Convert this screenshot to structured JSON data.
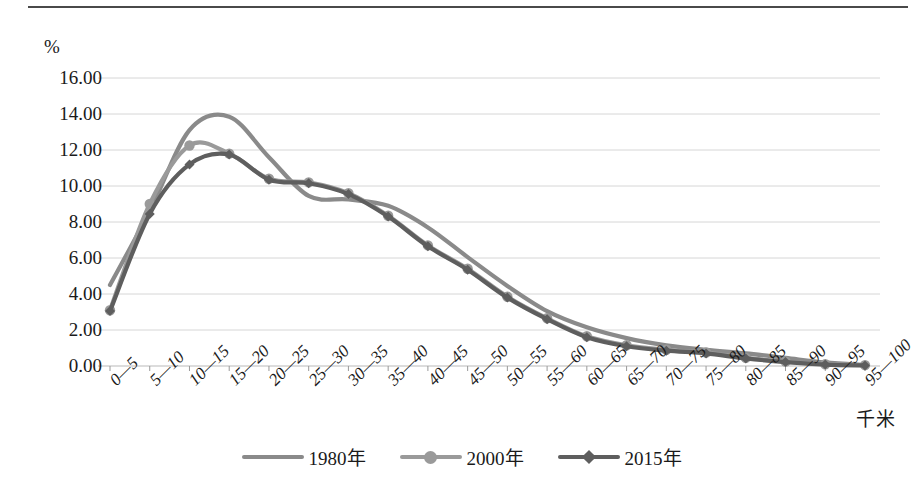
{
  "figure": {
    "y_unit_label": "%",
    "x_unit_label": "千米"
  },
  "legend": {
    "position": "bottom-center",
    "entries": [
      {
        "label": "1980年",
        "color": "#8a8a8a",
        "marker": "none"
      },
      {
        "label": "2000年",
        "color": "#9a9a9a",
        "marker": "circle"
      },
      {
        "label": "2015年",
        "color": "#5e5e5e",
        "marker": "diamond"
      }
    ]
  },
  "chart_data": {
    "type": "line",
    "title": "",
    "xlabel": "千米",
    "ylabel": "%",
    "ylim": [
      0,
      16
    ],
    "ytick_labels": [
      "0.00",
      "2.00",
      "4.00",
      "6.00",
      "8.00",
      "10.00",
      "12.00",
      "14.00",
      "16.00"
    ],
    "ytick_values": [
      0,
      2,
      4,
      6,
      8,
      10,
      12,
      14,
      16
    ],
    "grid": true,
    "categories": [
      "0—5",
      "5—10",
      "10—15",
      "15—20",
      "20—25",
      "25—30",
      "30—35",
      "35—40",
      "40—45",
      "45—50",
      "50—55",
      "55—60",
      "60—65",
      "65—70",
      "70—75",
      "75—80",
      "80—85",
      "85—90",
      "90—95",
      "95—100"
    ],
    "series": [
      {
        "name": "1980年",
        "color": "#8a8a8a",
        "marker": "none",
        "values": [
          4.5,
          8.6,
          13.1,
          13.85,
          11.6,
          9.45,
          9.25,
          8.9,
          7.7,
          6.05,
          4.45,
          3.05,
          2.15,
          1.55,
          1.15,
          0.9,
          0.7,
          0.45,
          0.2,
          0.05
        ]
      },
      {
        "name": "2000年",
        "color": "#9a9a9a",
        "marker": "circle",
        "values": [
          3.1,
          9.0,
          12.25,
          11.8,
          10.4,
          10.2,
          9.6,
          8.35,
          6.7,
          5.4,
          3.85,
          2.65,
          1.65,
          1.15,
          0.9,
          0.75,
          0.45,
          0.25,
          0.1,
          0.05
        ]
      },
      {
        "name": "2015年",
        "color": "#5e5e5e",
        "marker": "diamond",
        "values": [
          3.05,
          8.45,
          11.2,
          11.75,
          10.35,
          10.15,
          9.55,
          8.3,
          6.65,
          5.35,
          3.8,
          2.6,
          1.6,
          1.1,
          0.85,
          0.7,
          0.42,
          0.22,
          0.08,
          0.03
        ]
      }
    ]
  }
}
